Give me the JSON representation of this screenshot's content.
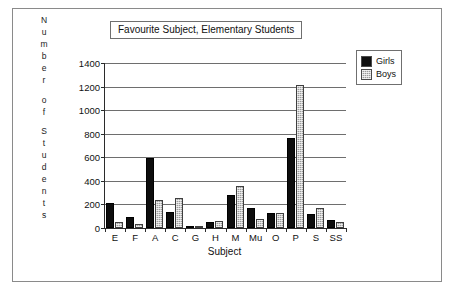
{
  "figure": {
    "y_axis_title_letters": [
      "N",
      "u",
      "m",
      "b",
      "e",
      "r",
      "",
      "o",
      "f",
      "",
      "S",
      "t",
      "u",
      "d",
      "e",
      "n",
      "t",
      "s"
    ]
  },
  "chart_data": {
    "type": "bar",
    "title": "Favourite Subject, Elementary Students",
    "xlabel": "Subject",
    "ylabel": "Number of Students",
    "categories": [
      "E",
      "F",
      "A",
      "C",
      "G",
      "H",
      "M",
      "Mu",
      "O",
      "P",
      "S",
      "SS"
    ],
    "series": [
      {
        "name": "Girls",
        "color": "#0d0d0d",
        "values": [
          215,
          90,
          595,
          140,
          10,
          55,
          280,
          170,
          130,
          760,
          120,
          65
        ]
      },
      {
        "name": "Boys",
        "color": "#9c9c9c",
        "values": [
          50,
          30,
          235,
          255,
          15,
          60,
          360,
          75,
          130,
          1210,
          170,
          50
        ]
      }
    ],
    "ylim": [
      0,
      1400
    ],
    "yticks": [
      0,
      200,
      400,
      600,
      800,
      1000,
      1200,
      1400
    ],
    "ytick_labels": [
      "0",
      "200",
      "400",
      "600",
      "800",
      "1000",
      "1200",
      "1400"
    ],
    "grid": true,
    "legend_position": "top-right",
    "legend_entries": [
      "Girls",
      "Boys"
    ]
  }
}
